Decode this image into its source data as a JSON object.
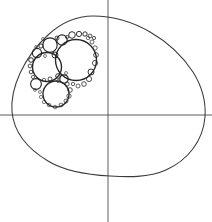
{
  "figure": {
    "width": 212,
    "height": 222,
    "background_color": "#ffffff",
    "curve_color": "#3a3a3a",
    "axis_color": "#4a4a4a",
    "circle_color": "#262626"
  },
  "chart_data": {
    "type": "scatter",
    "xlabel": "",
    "ylabel": "",
    "grid": false,
    "legend": null,
    "axes": {
      "origin": [
        108,
        115
      ],
      "horizontal_axis": {
        "y": 115,
        "x_start": 0,
        "x_end": 212
      },
      "vertical_axis": {
        "x": 108,
        "y_start": 0,
        "y_end": 222
      }
    },
    "outer_curve": {
      "name": "egg-shaped oval boundary",
      "kind": "closed smooth curve",
      "extremes": {
        "top": [
          93,
          16
        ],
        "right": [
          205,
          117
        ],
        "bottom": [
          110,
          176
        ],
        "left": [
          12,
          112
        ]
      }
    },
    "circles": [
      {
        "id": "c1",
        "cx": 76,
        "cy": 60,
        "r": 20.5,
        "level": 0
      },
      {
        "id": "c2",
        "cx": 47,
        "cy": 67,
        "r": 14.5,
        "level": 0
      },
      {
        "id": "c3",
        "cx": 56,
        "cy": 94,
        "r": 13.0,
        "level": 0
      },
      {
        "id": "c4",
        "cx": 50,
        "cy": 45,
        "r": 7.2,
        "level": 1
      },
      {
        "id": "c5",
        "cx": 37,
        "cy": 53,
        "r": 4.6,
        "level": 1
      },
      {
        "id": "c6",
        "cx": 62,
        "cy": 40,
        "r": 5.2,
        "level": 1
      },
      {
        "id": "c7",
        "cx": 36,
        "cy": 84,
        "r": 5.4,
        "level": 1
      },
      {
        "id": "c8",
        "cx": 64,
        "cy": 79,
        "r": 4.2,
        "level": 1
      },
      {
        "id": "c9",
        "cx": 72,
        "cy": 35,
        "r": 3.3,
        "level": 2
      },
      {
        "id": "c10",
        "cx": 79,
        "cy": 34,
        "r": 2.6,
        "level": 2
      },
      {
        "id": "c11",
        "cx": 85,
        "cy": 34,
        "r": 2.2,
        "level": 2
      },
      {
        "id": "c12",
        "cx": 90,
        "cy": 36,
        "r": 1.9,
        "level": 3
      },
      {
        "id": "c13",
        "cx": 94,
        "cy": 38,
        "r": 1.6,
        "level": 3
      },
      {
        "id": "c14",
        "cx": 31,
        "cy": 60,
        "r": 2.3,
        "level": 2
      },
      {
        "id": "c15",
        "cx": 30,
        "cy": 66,
        "r": 1.9,
        "level": 3
      },
      {
        "id": "c16",
        "cx": 31,
        "cy": 72,
        "r": 1.8,
        "level": 3
      },
      {
        "id": "c17",
        "cx": 33,
        "cy": 77,
        "r": 1.6,
        "level": 4
      },
      {
        "id": "c18",
        "cx": 41,
        "cy": 46,
        "r": 2.1,
        "level": 2
      },
      {
        "id": "c19",
        "cx": 57,
        "cy": 38,
        "r": 2.0,
        "level": 3
      },
      {
        "id": "c20",
        "cx": 58,
        "cy": 76,
        "r": 2.3,
        "level": 2
      },
      {
        "id": "c21",
        "cx": 50,
        "cy": 79,
        "r": 2.0,
        "level": 3
      },
      {
        "id": "c22",
        "cx": 44,
        "cy": 80,
        "r": 1.7,
        "level": 4
      },
      {
        "id": "c23",
        "cx": 67,
        "cy": 84,
        "r": 2.2,
        "level": 3
      },
      {
        "id": "c24",
        "cx": 70,
        "cy": 90,
        "r": 2.3,
        "level": 3
      },
      {
        "id": "c25",
        "cx": 69,
        "cy": 96,
        "r": 2.2,
        "level": 4
      },
      {
        "id": "c26",
        "cx": 66,
        "cy": 101,
        "r": 2.0,
        "level": 4
      },
      {
        "id": "c27",
        "cx": 61,
        "cy": 105,
        "r": 1.9,
        "level": 4
      },
      {
        "id": "c28",
        "cx": 55,
        "cy": 107,
        "r": 1.8,
        "level": 5
      },
      {
        "id": "c29",
        "cx": 49,
        "cy": 105,
        "r": 1.8,
        "level": 5
      },
      {
        "id": "c30",
        "cx": 44,
        "cy": 102,
        "r": 1.7,
        "level": 5
      },
      {
        "id": "c31",
        "cx": 41,
        "cy": 97,
        "r": 1.6,
        "level": 5
      },
      {
        "id": "c32",
        "cx": 40,
        "cy": 92,
        "r": 1.5,
        "level": 5
      },
      {
        "id": "c33",
        "cx": 91,
        "cy": 72,
        "r": 3.0,
        "level": 2
      },
      {
        "id": "c34",
        "cx": 89,
        "cy": 79,
        "r": 2.6,
        "level": 3
      },
      {
        "id": "c35",
        "cx": 84,
        "cy": 84,
        "r": 2.3,
        "level": 3
      },
      {
        "id": "c36",
        "cx": 78,
        "cy": 86,
        "r": 2.0,
        "level": 4
      },
      {
        "id": "c37",
        "cx": 73,
        "cy": 84,
        "r": 1.7,
        "level": 4
      },
      {
        "id": "c38",
        "cx": 95,
        "cy": 63,
        "r": 2.6,
        "level": 3
      },
      {
        "id": "c39",
        "cx": 96,
        "cy": 55,
        "r": 2.4,
        "level": 3
      },
      {
        "id": "c40",
        "cx": 95,
        "cy": 48,
        "r": 2.2,
        "level": 4
      },
      {
        "id": "c41",
        "cx": 92,
        "cy": 42,
        "r": 2.0,
        "level": 4
      },
      {
        "id": "c42",
        "cx": 88,
        "cy": 38,
        "r": 1.7,
        "level": 5
      },
      {
        "id": "c43",
        "cx": 55,
        "cy": 55,
        "r": 3.0,
        "level": 2
      },
      {
        "id": "c44",
        "cx": 58,
        "cy": 81,
        "r": 1.5,
        "level": 5
      },
      {
        "id": "c45",
        "cx": 45,
        "cy": 56,
        "r": 1.5,
        "level": 5
      },
      {
        "id": "c46",
        "cx": 66,
        "cy": 73,
        "r": 1.5,
        "level": 5
      },
      {
        "id": "c47",
        "cx": 35,
        "cy": 90,
        "r": 1.4,
        "level": 5
      },
      {
        "id": "c48",
        "cx": 43,
        "cy": 39,
        "r": 1.5,
        "level": 5
      },
      {
        "id": "c49",
        "cx": 36,
        "cy": 47,
        "r": 1.4,
        "level": 5
      },
      {
        "id": "c50",
        "cx": 67,
        "cy": 37,
        "r": 1.6,
        "level": 4
      }
    ]
  }
}
